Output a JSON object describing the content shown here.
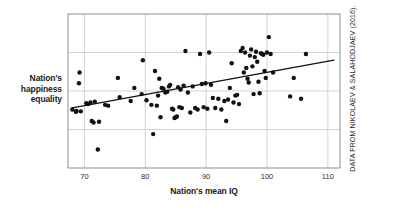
{
  "figure": {
    "width": 403,
    "height": 208,
    "background": "#ffffff"
  },
  "axes": {
    "y_label_lines": [
      "Nation's",
      "happiness",
      "equality"
    ],
    "y_label_full": "Nation's happiness equality",
    "x_label": "Nation's mean IQ"
  },
  "credit": {
    "text": "DATA FROM NIKOLAEV & SALAHODJAEV (2016)."
  },
  "colors": {
    "point": "#111111",
    "trendline": "#111111",
    "gridline": "#c8c8c8",
    "frame": "#8d8d8d",
    "text": "#1a1a1a",
    "background": "#ffffff"
  },
  "chart_data": {
    "type": "scatter",
    "title": "",
    "xlabel": "Nation's mean IQ",
    "ylabel": "Nation's happiness equality",
    "xlim": [
      67.3,
      112.0
    ],
    "ylim": [
      0,
      100
    ],
    "xticks": [
      70,
      80,
      90,
      100,
      110
    ],
    "xticklabels": [
      "70",
      "80",
      "90",
      "100",
      "110"
    ],
    "yticks": [],
    "yticklabels": [],
    "grid": true,
    "grid_axes": "both",
    "legend": null,
    "trendline": {
      "type": "linear-fit",
      "x_start": 68.0,
      "y_start": 39.0,
      "x_end": 111.0,
      "y_end": 70.0
    },
    "x": [
      68.0,
      68.6,
      68.7,
      69.1,
      69.2,
      69.4,
      70.3,
      70.6,
      71.0,
      71.2,
      71.5,
      71.7,
      72.2,
      72.4,
      73.4,
      73.9,
      75.5,
      75.8,
      77.6,
      78.2,
      79.4,
      79.6,
      80.2,
      81.0,
      81.3,
      81.6,
      81.9,
      82.1,
      82.3,
      82.5,
      82.7,
      83.0,
      83.3,
      83.6,
      83.9,
      84.1,
      84.4,
      84.6,
      84.8,
      85.0,
      85.2,
      85.4,
      85.6,
      85.8,
      86.0,
      86.3,
      86.6,
      87.0,
      87.4,
      87.8,
      88.2,
      88.6,
      89.0,
      89.3,
      89.6,
      89.9,
      90.2,
      90.5,
      90.8,
      91.1,
      91.5,
      92.0,
      92.5,
      93.0,
      93.3,
      93.6,
      93.9,
      94.2,
      94.5,
      94.8,
      95.1,
      95.4,
      95.7,
      96.0,
      96.2,
      96.4,
      96.6,
      96.8,
      97.0,
      97.2,
      97.4,
      97.6,
      97.8,
      98.0,
      98.2,
      98.4,
      98.6,
      98.8,
      99.0,
      99.2,
      99.4,
      99.6,
      99.8,
      100.0,
      100.3,
      100.6,
      101.0,
      103.8,
      104.4,
      105.6,
      106.4
    ],
    "y": [
      38.0,
      36.5,
      37.0,
      55.0,
      62.0,
      36.8,
      42.0,
      41.5,
      42.5,
      30.5,
      29.5,
      43.0,
      12.0,
      30.0,
      41.0,
      40.5,
      58.5,
      46.0,
      43.5,
      52.0,
      48.0,
      70.0,
      44.0,
      41.0,
      22.0,
      63.0,
      40.5,
      47.0,
      58.0,
      33.0,
      52.0,
      51.5,
      49.0,
      49.5,
      53.0,
      54.0,
      38.5,
      38.0,
      32.5,
      33.0,
      33.5,
      52.5,
      39.5,
      51.0,
      39.0,
      53.5,
      76.0,
      49.0,
      36.0,
      53.0,
      39.0,
      38.0,
      74.0,
      54.5,
      39.5,
      55.0,
      38.5,
      75.0,
      54.0,
      45.5,
      39.0,
      45.0,
      38.0,
      43.5,
      30.5,
      44.5,
      52.0,
      68.0,
      42.5,
      47.0,
      47.5,
      41.5,
      76.0,
      78.0,
      62.0,
      75.0,
      65.0,
      58.0,
      55.5,
      73.0,
      77.0,
      66.0,
      48.0,
      72.0,
      75.5,
      69.0,
      56.0,
      48.5,
      74.5,
      74.0,
      73.5,
      63.0,
      58.5,
      75.0,
      85.0,
      74.0,
      62.0,
      46.5,
      58.5,
      45.0,
      74.0
    ]
  }
}
